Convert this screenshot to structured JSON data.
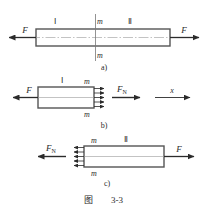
{
  "figure": {
    "caption_prefix": "图",
    "caption_number": "3-3",
    "caption_full": "图 3-3"
  },
  "panels": [
    {
      "id": "a",
      "label": "a)",
      "region_left_label": "Ⅰ",
      "region_right_label": "Ⅱ",
      "section_label_top": "m",
      "section_label_bottom": "m",
      "force_left_label": "F",
      "force_right_label": "F"
    },
    {
      "id": "b",
      "label": "b)",
      "region_label": "Ⅰ",
      "section_label_top": "m",
      "section_label_bottom": "m",
      "force_left_label": "F",
      "internal_force_label": "F",
      "internal_force_subscript": "N",
      "axis_label": "x"
    },
    {
      "id": "c",
      "label": "c)",
      "region_label": "Ⅱ",
      "section_label_top": "m",
      "section_label_bottom": "m",
      "internal_force_label": "F",
      "internal_force_subscript": "N",
      "force_right_label": "F"
    }
  ],
  "colors": {
    "outline": "#555555",
    "ink": "#2b2b2b",
    "centerline": "#999999",
    "section_line": "#777777",
    "background": "#ffffff"
  },
  "counts": {
    "distributed_arrows_b": 5,
    "distributed_arrows_c": 5
  }
}
